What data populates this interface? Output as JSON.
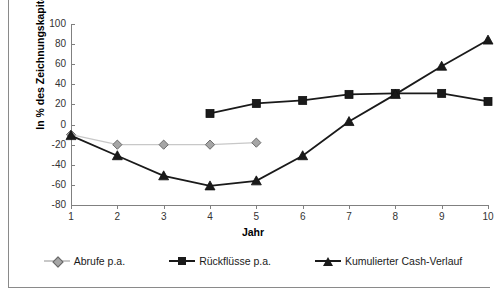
{
  "chart_data": {
    "type": "line",
    "title": "",
    "xlabel": "Jahr",
    "ylabel": "In % des Zeichnungskapitals",
    "x": [
      1,
      2,
      3,
      4,
      5,
      6,
      7,
      8,
      9,
      10
    ],
    "xlim": [
      1,
      10
    ],
    "ylim": [
      -80,
      100
    ],
    "ytick_labels": [
      "100",
      "80",
      "60",
      "40",
      "20",
      "0",
      "-20",
      "-40",
      "-60",
      "-80"
    ],
    "ytick_values": [
      100,
      80,
      60,
      40,
      20,
      0,
      -20,
      -40,
      -60,
      -80
    ],
    "xtick_labels": [
      "1",
      "2",
      "3",
      "4",
      "5",
      "6",
      "7",
      "8",
      "9",
      "10"
    ],
    "grid": false,
    "legend_position": "bottom",
    "series": [
      {
        "name": "Abrufe p.a.",
        "marker": "diamond",
        "color": "#a6a6a6",
        "line_color": "#c8c8c8",
        "x": [
          1,
          2,
          3,
          4,
          5
        ],
        "values": [
          -10,
          -20,
          -20,
          -20,
          -18
        ]
      },
      {
        "name": "Rückflüsse p.a.",
        "marker": "square",
        "color": "#1a1a1a",
        "line_color": "#1a1a1a",
        "x": [
          4,
          5,
          6,
          7,
          8,
          9,
          10
        ],
        "values": [
          11,
          21,
          24,
          30,
          31,
          31,
          23
        ]
      },
      {
        "name": "Kumulierter Cash-Verlauf",
        "marker": "triangle",
        "color": "#1a1a1a",
        "line_color": "#1a1a1a",
        "x": [
          1,
          2,
          3,
          4,
          5,
          6,
          7,
          8,
          9,
          10
        ],
        "values": [
          -11,
          -31,
          -51,
          -61,
          -56,
          -31,
          3,
          30,
          58,
          84
        ]
      }
    ]
  },
  "axes": {
    "y_title": "In % des Zeichnungskapitals",
    "x_title": "Jahr"
  },
  "legend": {
    "items": [
      {
        "label": "Abrufe p.a."
      },
      {
        "label": "Rückflüsse p.a."
      },
      {
        "label": "Kumulierter Cash-Verlauf"
      }
    ]
  }
}
